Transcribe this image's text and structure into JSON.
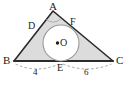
{
  "figure": {
    "type": "geometry-diagram",
    "colors": {
      "stroke": "#2b2b2b",
      "triangle_fill": "#dcdcdc",
      "circle_fill": "#ffffff",
      "circle_stroke": "#9a9a9a",
      "dashed_arc": "#9a9a9a",
      "text": "#1c1c1c"
    },
    "vertices": [
      {
        "name": "A",
        "label": "A",
        "x": 53,
        "y": 11
      },
      {
        "name": "B",
        "label": "B",
        "x": 14,
        "y": 61
      },
      {
        "name": "C",
        "label": "C",
        "x": 113,
        "y": 61
      }
    ],
    "tangent_points": [
      {
        "name": "D",
        "label": "D",
        "side": "AB",
        "x": 37,
        "y": 28
      },
      {
        "name": "E",
        "label": "E",
        "side": "BC",
        "x": 61,
        "y": 61
      },
      {
        "name": "F",
        "label": "F",
        "side": "AC",
        "x": 72,
        "y": 25
      }
    ],
    "center": {
      "name": "O",
      "label": "O",
      "x": 61,
      "y": 43
    },
    "circle": {
      "cx": 61,
      "cy": 43,
      "r": 18
    },
    "angle_marker": {
      "at": "A",
      "visible": true
    },
    "measurements": [
      {
        "label": "4",
        "from": "B",
        "to": "E",
        "x": 36,
        "y": 72
      },
      {
        "label": "6",
        "from": "E",
        "to": "C",
        "x": 86,
        "y": 72
      }
    ]
  }
}
